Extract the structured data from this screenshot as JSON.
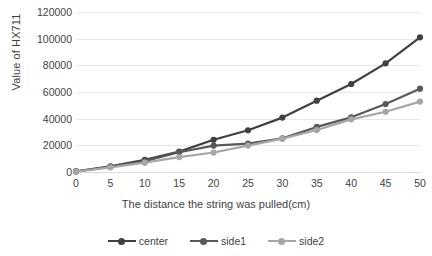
{
  "chart_data": {
    "type": "line",
    "title": "",
    "xlabel": "The distance the string was pulled(cm)",
    "ylabel": "Value of HX711",
    "x": [
      0,
      5,
      10,
      15,
      20,
      25,
      30,
      35,
      40,
      45,
      50
    ],
    "xticklabels": [
      "0",
      "5",
      "10",
      "15",
      "20",
      "25",
      "30",
      "35",
      "40",
      "45",
      "50"
    ],
    "yticklabels": [
      "0",
      "20000",
      "40000",
      "60000",
      "80000",
      "100000",
      "120000"
    ],
    "yticks": [
      0,
      20000,
      40000,
      60000,
      80000,
      100000,
      120000
    ],
    "xlim": [
      0,
      50
    ],
    "ylim": [
      0,
      120000
    ],
    "grid": true,
    "legend_position": "bottom",
    "series": [
      {
        "name": "center",
        "color": "#404040",
        "values": [
          500,
          4200,
          9200,
          15300,
          24200,
          31300,
          40800,
          53500,
          66000,
          81500,
          101000
        ]
      },
      {
        "name": "side1",
        "color": "#595959",
        "values": [
          400,
          3900,
          8200,
          14800,
          19800,
          21300,
          25200,
          33800,
          41000,
          51000,
          62500
        ]
      },
      {
        "name": "side2",
        "color": "#a6a6a6",
        "values": [
          300,
          3500,
          7000,
          11200,
          14600,
          19800,
          25000,
          31500,
          39500,
          45200,
          52800
        ]
      }
    ]
  },
  "legend": {
    "items": [
      {
        "label": "center"
      },
      {
        "label": "side1"
      },
      {
        "label": "side2"
      }
    ]
  },
  "colors": {
    "center": "#404040",
    "side1": "#595959",
    "side2": "#a6a6a6",
    "gridline": "#e8e8e8",
    "text": "#3f3f3f",
    "background": "#ffffff"
  }
}
